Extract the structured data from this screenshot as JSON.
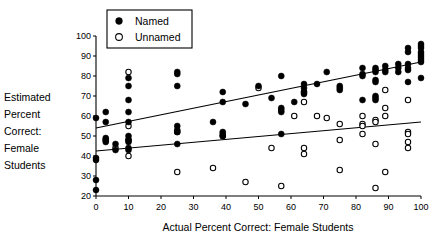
{
  "chart_data": {
    "type": "scatter",
    "title": "",
    "xlabel": "Actual Percent Correct: Female Students",
    "ylabel": "Estimated Percent Correct: Female Students",
    "ylabel_lines": [
      "Estimated",
      "Percent",
      "Correct:",
      "Female",
      "Students"
    ],
    "xlim": [
      0,
      100
    ],
    "ylim": [
      20,
      100
    ],
    "xticks": [
      0,
      10,
      20,
      30,
      40,
      50,
      60,
      70,
      80,
      90,
      100
    ],
    "yticks": [
      20,
      30,
      40,
      50,
      60,
      70,
      80,
      90,
      100
    ],
    "xtick_labels": [
      "0",
      "10",
      "20",
      "30",
      "40",
      "50",
      "60",
      "70",
      "80",
      "90",
      "100"
    ],
    "ytick_labels": [
      "20",
      "30",
      "40",
      "50",
      "60",
      "70",
      "80",
      "90",
      "100"
    ],
    "grid": false,
    "legend_position": "top-left",
    "legend": [
      {
        "name": "Named",
        "marker": "filled-circle",
        "color": "#000000"
      },
      {
        "name": "Unnamed",
        "marker": "open-circle",
        "color": "#000000"
      }
    ],
    "series": [
      {
        "name": "Named",
        "marker": "filled-circle",
        "points": [
          [
            0,
            59
          ],
          [
            0,
            39
          ],
          [
            0,
            38
          ],
          [
            0,
            28
          ],
          [
            0,
            23
          ],
          [
            3,
            62
          ],
          [
            3,
            57
          ],
          [
            3,
            49
          ],
          [
            3,
            48
          ],
          [
            3,
            47
          ],
          [
            6,
            46
          ],
          [
            6,
            43
          ],
          [
            10,
            79
          ],
          [
            10,
            75
          ],
          [
            10,
            68
          ],
          [
            10,
            62
          ],
          [
            10,
            57
          ],
          [
            10,
            50
          ],
          [
            10,
            48
          ],
          [
            10,
            47
          ],
          [
            10,
            44
          ],
          [
            10,
            43
          ],
          [
            25,
            82
          ],
          [
            25,
            81
          ],
          [
            25,
            75
          ],
          [
            25,
            55
          ],
          [
            25,
            53
          ],
          [
            25,
            52
          ],
          [
            25,
            46
          ],
          [
            36,
            57
          ],
          [
            39,
            72
          ],
          [
            39,
            67
          ],
          [
            39,
            52
          ],
          [
            39,
            50
          ],
          [
            46,
            66
          ],
          [
            50,
            75
          ],
          [
            54,
            69
          ],
          [
            57,
            80
          ],
          [
            57,
            64
          ],
          [
            57,
            62
          ],
          [
            57,
            51
          ],
          [
            61,
            67
          ],
          [
            64,
            76
          ],
          [
            64,
            74
          ],
          [
            64,
            72
          ],
          [
            64,
            71
          ],
          [
            68,
            76
          ],
          [
            71,
            82
          ],
          [
            75,
            75
          ],
          [
            75,
            74
          ],
          [
            75,
            73
          ],
          [
            82,
            84
          ],
          [
            82,
            81
          ],
          [
            82,
            80
          ],
          [
            82,
            68
          ],
          [
            86,
            84
          ],
          [
            86,
            83
          ],
          [
            86,
            82
          ],
          [
            86,
            78
          ],
          [
            86,
            77
          ],
          [
            86,
            70
          ],
          [
            86,
            69
          ],
          [
            86,
            68
          ],
          [
            89,
            85
          ],
          [
            89,
            83
          ],
          [
            89,
            82
          ],
          [
            93,
            86
          ],
          [
            93,
            84
          ],
          [
            93,
            82
          ],
          [
            96,
            94
          ],
          [
            96,
            92
          ],
          [
            96,
            86
          ],
          [
            96,
            84
          ],
          [
            96,
            83
          ],
          [
            96,
            77
          ],
          [
            100,
            96
          ],
          [
            100,
            95
          ],
          [
            100,
            94
          ],
          [
            100,
            92
          ],
          [
            100,
            91
          ],
          [
            100,
            90
          ],
          [
            100,
            89
          ],
          [
            100,
            88
          ],
          [
            100,
            87
          ],
          [
            100,
            79
          ]
        ]
      },
      {
        "name": "Unnamed",
        "marker": "open-circle",
        "points": [
          [
            3,
            48
          ],
          [
            6,
            44
          ],
          [
            10,
            82
          ],
          [
            10,
            55
          ],
          [
            10,
            48
          ],
          [
            10,
            40
          ],
          [
            25,
            52
          ],
          [
            25,
            32
          ],
          [
            36,
            34
          ],
          [
            39,
            51
          ],
          [
            39,
            50
          ],
          [
            46,
            27
          ],
          [
            50,
            74
          ],
          [
            54,
            44
          ],
          [
            57,
            63
          ],
          [
            57,
            25
          ],
          [
            61,
            60
          ],
          [
            64,
            72
          ],
          [
            64,
            67
          ],
          [
            64,
            44
          ],
          [
            64,
            41
          ],
          [
            68,
            60
          ],
          [
            71,
            59
          ],
          [
            75,
            56
          ],
          [
            75,
            48
          ],
          [
            75,
            33
          ],
          [
            82,
            60
          ],
          [
            82,
            56
          ],
          [
            82,
            55
          ],
          [
            82,
            51
          ],
          [
            86,
            58
          ],
          [
            86,
            57
          ],
          [
            86,
            46
          ],
          [
            86,
            24
          ],
          [
            89,
            73
          ],
          [
            89,
            64
          ],
          [
            89,
            60
          ],
          [
            89,
            32
          ],
          [
            96,
            68
          ],
          [
            96,
            52
          ],
          [
            96,
            51
          ],
          [
            96,
            47
          ],
          [
            96,
            44
          ]
        ]
      }
    ],
    "fit_lines": [
      {
        "name": "Named fit",
        "x": [
          0,
          100
        ],
        "y": [
          54,
          87
        ]
      },
      {
        "name": "Unnamed fit",
        "x": [
          0,
          100
        ],
        "y": [
          42.5,
          57
        ]
      }
    ]
  }
}
